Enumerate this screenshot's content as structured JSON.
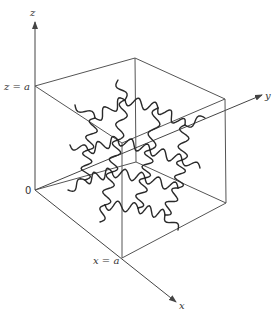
{
  "figure": {
    "axes": {
      "x_label": "x",
      "y_label": "y",
      "z_label": "z"
    },
    "annotations": {
      "z_eq_a": "z = a",
      "x_eq_a": "x = a",
      "origin": "0"
    },
    "colors": {
      "lines": "#555555",
      "chains": "#2a2a2a"
    }
  }
}
